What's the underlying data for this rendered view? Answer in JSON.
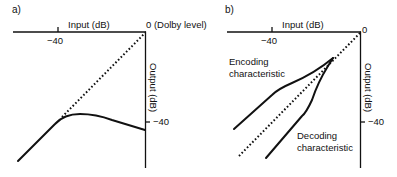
{
  "panels": [
    {
      "id": "a",
      "label": "a)",
      "x_axis_label": "Input (dB)",
      "x_tick_label": "−40",
      "origin_label": "0 (Dolby level)",
      "y_axis_label": "Output (dB)",
      "y_tick_label": "−40",
      "curves": [
        {
          "name": "unity-reference",
          "style": "dotted"
        },
        {
          "name": "compression-characteristic",
          "style": "solid"
        }
      ]
    },
    {
      "id": "b",
      "label": "b)",
      "x_axis_label": "Input (dB)",
      "x_tick_label": "−40",
      "origin_label": "0",
      "y_axis_label": "Output (dB)",
      "y_tick_label": "−40",
      "encoding_label_line1": "Encoding",
      "encoding_label_line2": "characteristic",
      "decoding_label_line1": "Decoding",
      "decoding_label_line2": "characteristic",
      "curves": [
        {
          "name": "encoding-characteristic",
          "style": "solid"
        },
        {
          "name": "unity-reference",
          "style": "dotted"
        },
        {
          "name": "decoding-characteristic",
          "style": "solid"
        }
      ]
    }
  ]
}
